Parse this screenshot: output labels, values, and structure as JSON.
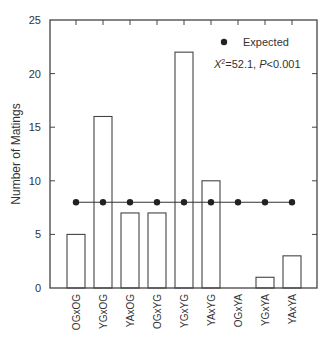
{
  "chart_data": {
    "type": "bar",
    "title": "",
    "xlabel": "",
    "ylabel": "Number of Matings",
    "ylim": [
      0,
      25
    ],
    "yticks": [
      0,
      5,
      10,
      15,
      20,
      25
    ],
    "grid": false,
    "categories": [
      "OGxOG",
      "YGxOG",
      "YAxOG",
      "OGxYG",
      "YGxYG",
      "YAxYG",
      "OGxYA",
      "YGxYA",
      "YAxYA"
    ],
    "series": [
      {
        "name": "Observed",
        "type": "bar",
        "values": [
          5,
          16,
          7,
          7,
          22,
          10,
          0,
          1,
          3
        ]
      },
      {
        "name": "Expected",
        "type": "line-marker",
        "values": [
          8,
          8,
          8,
          8,
          8,
          8,
          8,
          8,
          8
        ]
      }
    ],
    "legend": {
      "position": "upper right",
      "entries": [
        "Expected"
      ]
    },
    "annotations": [
      "X²=52.1, P<0.001"
    ]
  },
  "legend": {
    "expected_label": "Expected"
  },
  "annotation": {
    "chi_symbol": "X",
    "chi_sup": "2",
    "chi_rest": "=52.1, ",
    "p_symbol": "P",
    "p_rest": "<0.001"
  },
  "axis": {
    "ylabel": "Number of Matings"
  },
  "colors": {
    "axis": "#444444",
    "bar_stroke": "#444444",
    "bar_fill": "#ffffff",
    "marker": "#222222"
  }
}
